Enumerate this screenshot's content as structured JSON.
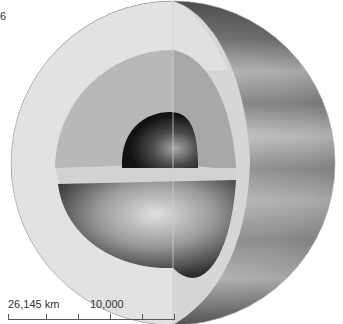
{
  "figure": {
    "label_fragment": "6",
    "layers": [
      {
        "name": "core",
        "color": "#2a2a2a"
      },
      {
        "name": "mantle",
        "color": "#b4b4b4"
      },
      {
        "name": "outer-shell",
        "color": "#dedede"
      },
      {
        "name": "atmosphere-surface",
        "color": "#6e6e6e"
      }
    ]
  },
  "scale_bar": {
    "left_label": "26,145 km",
    "mid_label": "10,000",
    "tick_count": 6
  }
}
